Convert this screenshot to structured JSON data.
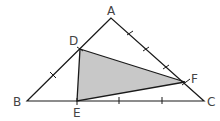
{
  "diagram": {
    "type": "geometry-triangle",
    "outer_triangle": [
      "A",
      "B",
      "C"
    ],
    "inner_triangle": [
      "D",
      "E",
      "F"
    ],
    "inner_fill": "#c8c8c8",
    "stroke": "#1a1a1a",
    "points": {
      "A": {
        "label": "A",
        "x": 111,
        "y": 18
      },
      "B": {
        "label": "B",
        "x": 27,
        "y": 101
      },
      "C": {
        "label": "C",
        "x": 204,
        "y": 101
      },
      "D": {
        "label": "D",
        "x": 80,
        "y": 49
      },
      "E": {
        "label": "E",
        "x": 77,
        "y": 101
      },
      "F": {
        "label": "F",
        "x": 185,
        "y": 82
      }
    },
    "tick_marks": {
      "BD": 1,
      "AF": 3,
      "EC": 2
    }
  }
}
